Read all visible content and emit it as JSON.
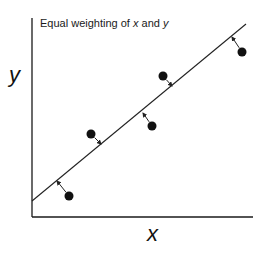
{
  "diagram": {
    "title_prefix": "Equal weighting of ",
    "title_var1": "x",
    "title_mid": " and ",
    "title_var2": "y",
    "xlabel": "x",
    "ylabel": "y",
    "colors": {
      "axis": "#1a1a1a",
      "line": "#222222",
      "points": "#111111",
      "arrows": "#222222"
    },
    "axes": {
      "origin": [
        32,
        217
      ],
      "x_end": [
        253,
        217
      ],
      "y_end": [
        32,
        18
      ]
    },
    "fit_line": {
      "from": [
        32,
        201
      ],
      "to": [
        246,
        24
      ]
    },
    "points": [
      {
        "cx": 69,
        "cy": 196,
        "foot": [
          57,
          181
        ]
      },
      {
        "cx": 91,
        "cy": 134,
        "foot": [
          101,
          144
        ]
      },
      {
        "cx": 152,
        "cy": 126,
        "foot": [
          143,
          113
        ]
      },
      {
        "cx": 163,
        "cy": 76,
        "foot": [
          172,
          86
        ]
      },
      {
        "cx": 242,
        "cy": 52,
        "foot": [
          232,
          37
        ]
      }
    ]
  }
}
